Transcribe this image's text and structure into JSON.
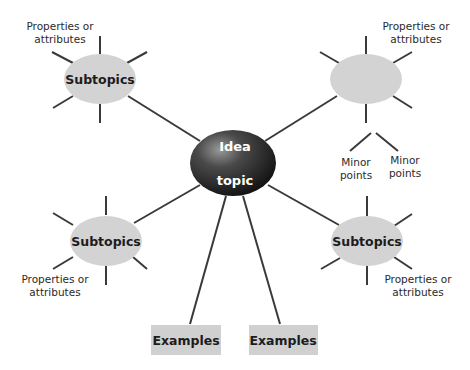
{
  "diagram": {
    "type": "mind-map",
    "center": {
      "line1": "Idea",
      "line2": "topic",
      "fill": "#1a1a1a"
    },
    "subtopics": [
      {
        "id": "top-left",
        "label": "Subtopics",
        "property_label": [
          "Properties or",
          "attributes"
        ]
      },
      {
        "id": "top-right",
        "label": "Subtopics",
        "property_label": [
          "Properties or",
          "attributes"
        ]
      },
      {
        "id": "bottom-left",
        "label": "Subtopics",
        "property_label": [
          "Properties or",
          "attributes"
        ]
      },
      {
        "id": "bottom-right",
        "label": "Subtopics",
        "property_label": [
          "Properties or",
          "attributes"
        ]
      }
    ],
    "minor_points": [
      {
        "line1": "Minor",
        "line2": "points"
      },
      {
        "line1": "Minor",
        "line2": "points"
      }
    ],
    "examples": [
      {
        "label": "Examples"
      },
      {
        "label": "Examples"
      }
    ],
    "colors": {
      "subtopic_fill": "#d3d3d3",
      "example_fill": "#d0d0d0",
      "line": "#3a3a3a",
      "center_fill": "#1a1a1a",
      "center_highlight": "#8a8a8a"
    }
  }
}
